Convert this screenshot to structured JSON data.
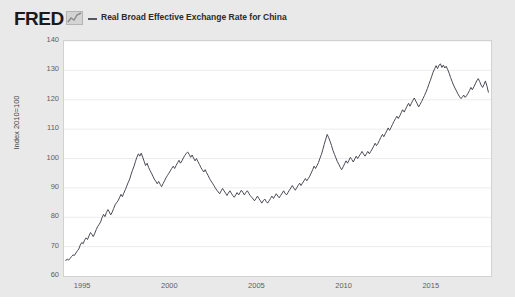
{
  "header": {
    "logo_text": "FRED",
    "logo_icon": "mini-chart-icon",
    "series_label": "Real Broad Effective Exchange Rate for China"
  },
  "colors": {
    "figure_background": "#e9e9e9",
    "plot_background": "#ffffff",
    "line": "#4a4a54",
    "grid": "#ececec",
    "frame": "#d2d2d2",
    "tick_text": "#5e5e5e"
  },
  "chart_data": {
    "type": "line",
    "title": "Real Broad Effective Exchange Rate for China",
    "xlabel": "",
    "ylabel": "Index 2010=100",
    "ylim": [
      60,
      140
    ],
    "xlim": [
      1993.9,
      2018.4
    ],
    "ytick_labels": [
      "140",
      "130",
      "120",
      "110",
      "100",
      "90",
      "80",
      "70",
      "60"
    ],
    "ytick_values": [
      140,
      130,
      120,
      110,
      100,
      90,
      80,
      70,
      60
    ],
    "xtick_labels": [
      "1995",
      "2000",
      "2005",
      "2010",
      "2015"
    ],
    "xtick_values": [
      1995,
      2000,
      2005,
      2010,
      2015
    ],
    "grid": true,
    "legend_position": "top",
    "series": [
      {
        "name": "Real Broad Effective Exchange Rate for China",
        "units": "Index 2010=100",
        "x": [
          1994.0,
          1994.08,
          1994.17,
          1994.25,
          1994.33,
          1994.42,
          1994.5,
          1994.58,
          1994.67,
          1994.75,
          1994.83,
          1994.92,
          1995.0,
          1995.08,
          1995.17,
          1995.25,
          1995.33,
          1995.42,
          1995.5,
          1995.58,
          1995.67,
          1995.75,
          1995.83,
          1995.92,
          1996.0,
          1996.08,
          1996.17,
          1996.25,
          1996.33,
          1996.42,
          1996.5,
          1996.58,
          1996.67,
          1996.75,
          1996.83,
          1996.92,
          1997.0,
          1997.08,
          1997.17,
          1997.25,
          1997.33,
          1997.42,
          1997.5,
          1997.58,
          1997.67,
          1997.75,
          1997.83,
          1997.92,
          1998.0,
          1998.08,
          1998.17,
          1998.25,
          1998.33,
          1998.42,
          1998.5,
          1998.58,
          1998.67,
          1998.75,
          1998.83,
          1998.92,
          1999.0,
          1999.08,
          1999.17,
          1999.25,
          1999.33,
          1999.42,
          1999.5,
          1999.58,
          1999.67,
          1999.75,
          1999.83,
          1999.92,
          2000.0,
          2000.08,
          2000.17,
          2000.25,
          2000.33,
          2000.42,
          2000.5,
          2000.58,
          2000.67,
          2000.75,
          2000.83,
          2000.92,
          2001.0,
          2001.08,
          2001.17,
          2001.25,
          2001.33,
          2001.42,
          2001.5,
          2001.58,
          2001.67,
          2001.75,
          2001.83,
          2001.92,
          2002.0,
          2002.08,
          2002.17,
          2002.25,
          2002.33,
          2002.42,
          2002.5,
          2002.58,
          2002.67,
          2002.75,
          2002.83,
          2002.92,
          2003.0,
          2003.08,
          2003.17,
          2003.25,
          2003.33,
          2003.42,
          2003.5,
          2003.58,
          2003.67,
          2003.75,
          2003.83,
          2003.92,
          2004.0,
          2004.08,
          2004.17,
          2004.25,
          2004.33,
          2004.42,
          2004.5,
          2004.58,
          2004.67,
          2004.75,
          2004.83,
          2004.92,
          2005.0,
          2005.08,
          2005.17,
          2005.25,
          2005.33,
          2005.42,
          2005.5,
          2005.58,
          2005.67,
          2005.75,
          2005.83,
          2005.92,
          2006.0,
          2006.08,
          2006.17,
          2006.25,
          2006.33,
          2006.42,
          2006.5,
          2006.58,
          2006.67,
          2006.75,
          2006.83,
          2006.92,
          2007.0,
          2007.08,
          2007.17,
          2007.25,
          2007.33,
          2007.42,
          2007.5,
          2007.58,
          2007.67,
          2007.75,
          2007.83,
          2007.92,
          2008.0,
          2008.08,
          2008.17,
          2008.25,
          2008.33,
          2008.42,
          2008.5,
          2008.58,
          2008.67,
          2008.75,
          2008.83,
          2008.92,
          2009.0,
          2009.08,
          2009.17,
          2009.25,
          2009.33,
          2009.42,
          2009.5,
          2009.58,
          2009.67,
          2009.75,
          2009.83,
          2009.92,
          2010.0,
          2010.08,
          2010.17,
          2010.25,
          2010.33,
          2010.42,
          2010.5,
          2010.58,
          2010.67,
          2010.75,
          2010.83,
          2010.92,
          2011.0,
          2011.08,
          2011.17,
          2011.25,
          2011.33,
          2011.42,
          2011.5,
          2011.58,
          2011.67,
          2011.75,
          2011.83,
          2011.92,
          2012.0,
          2012.08,
          2012.17,
          2012.25,
          2012.33,
          2012.42,
          2012.5,
          2012.58,
          2012.67,
          2012.75,
          2012.83,
          2012.92,
          2013.0,
          2013.08,
          2013.17,
          2013.25,
          2013.33,
          2013.42,
          2013.5,
          2013.58,
          2013.67,
          2013.75,
          2013.83,
          2013.92,
          2014.0,
          2014.08,
          2014.17,
          2014.25,
          2014.33,
          2014.42,
          2014.5,
          2014.58,
          2014.67,
          2014.75,
          2014.83,
          2014.92,
          2015.0,
          2015.08,
          2015.17,
          2015.25,
          2015.33,
          2015.42,
          2015.5,
          2015.58,
          2015.67,
          2015.75,
          2015.83,
          2015.92,
          2016.0,
          2016.08,
          2016.17,
          2016.25,
          2016.33,
          2016.42,
          2016.5,
          2016.58,
          2016.67,
          2016.75,
          2016.83,
          2016.92,
          2017.0,
          2017.08,
          2017.17,
          2017.25,
          2017.33,
          2017.42,
          2017.5,
          2017.58,
          2017.67,
          2017.75,
          2017.83,
          2017.92,
          2018.0,
          2018.08,
          2018.17,
          2018.25
        ],
        "values": [
          65.2,
          65.8,
          65.4,
          66.0,
          66.6,
          67.2,
          67.0,
          67.8,
          68.6,
          69.2,
          70.5,
          71.4,
          71.0,
          72.2,
          73.0,
          72.4,
          73.6,
          74.8,
          74.2,
          73.4,
          74.6,
          75.8,
          76.8,
          77.6,
          78.4,
          79.8,
          81.0,
          80.2,
          81.6,
          82.6,
          81.8,
          80.8,
          81.8,
          83.0,
          84.2,
          85.0,
          85.6,
          86.6,
          87.8,
          87.0,
          88.2,
          89.4,
          90.6,
          91.8,
          93.0,
          94.6,
          96.0,
          97.4,
          99.0,
          100.4,
          101.6,
          100.8,
          101.8,
          100.4,
          99.0,
          97.6,
          98.4,
          97.0,
          96.0,
          95.0,
          94.0,
          93.0,
          92.2,
          91.4,
          92.2,
          91.2,
          90.4,
          91.4,
          92.4,
          93.4,
          94.2,
          95.0,
          95.8,
          96.6,
          97.4,
          96.6,
          97.6,
          98.6,
          99.4,
          98.4,
          99.2,
          100.2,
          101.0,
          101.8,
          102.2,
          101.4,
          100.4,
          101.2,
          100.2,
          99.2,
          100.0,
          99.0,
          98.0,
          97.0,
          96.2,
          95.4,
          96.2,
          95.2,
          94.2,
          93.2,
          92.4,
          91.6,
          90.8,
          90.0,
          89.2,
          88.6,
          88.0,
          89.0,
          89.8,
          89.0,
          88.2,
          87.4,
          88.2,
          89.0,
          88.2,
          87.4,
          86.8,
          87.6,
          88.4,
          87.6,
          88.4,
          89.2,
          88.4,
          87.6,
          88.4,
          89.0,
          88.2,
          87.4,
          86.8,
          86.2,
          85.6,
          86.4,
          87.2,
          86.4,
          85.6,
          84.8,
          85.6,
          86.2,
          85.4,
          84.8,
          85.6,
          86.4,
          87.2,
          86.4,
          87.2,
          88.0,
          87.2,
          86.6,
          87.4,
          88.2,
          89.0,
          88.2,
          87.6,
          88.4,
          89.2,
          90.0,
          90.8,
          90.0,
          89.2,
          90.0,
          90.8,
          91.6,
          90.8,
          91.6,
          92.4,
          93.2,
          92.4,
          93.2,
          94.0,
          95.0,
          96.2,
          97.4,
          96.6,
          97.6,
          98.6,
          100.0,
          101.4,
          103.0,
          104.8,
          106.6,
          108.2,
          107.2,
          105.8,
          104.4,
          102.8,
          101.4,
          100.2,
          99.0,
          98.0,
          97.0,
          96.2,
          97.2,
          98.2,
          99.2,
          98.4,
          99.4,
          100.4,
          99.6,
          98.8,
          99.8,
          100.8,
          100.0,
          100.8,
          101.6,
          102.4,
          101.6,
          100.8,
          101.6,
          102.4,
          101.6,
          102.4,
          103.2,
          104.2,
          105.2,
          104.4,
          105.2,
          106.2,
          107.2,
          108.2,
          107.4,
          108.4,
          109.4,
          110.4,
          109.6,
          110.6,
          111.6,
          112.6,
          113.6,
          114.4,
          113.6,
          114.6,
          115.6,
          116.6,
          115.8,
          116.8,
          117.8,
          118.8,
          117.8,
          118.8,
          119.8,
          120.6,
          119.6,
          118.6,
          117.6,
          118.4,
          119.4,
          120.4,
          121.4,
          122.6,
          123.8,
          125.2,
          126.6,
          128.0,
          129.4,
          130.6,
          131.6,
          130.6,
          131.8,
          132.2,
          131.0,
          131.8,
          130.8,
          131.4,
          130.2,
          129.0,
          127.6,
          126.2,
          125.0,
          124.0,
          123.0,
          122.0,
          121.2,
          120.4,
          120.8,
          121.6,
          120.8,
          121.4,
          122.2,
          123.2,
          124.2,
          123.4,
          124.4,
          125.4,
          126.4,
          127.2,
          126.2,
          125.0,
          124.2,
          125.2,
          126.4,
          124.6,
          122.6
        ]
      }
    ]
  }
}
